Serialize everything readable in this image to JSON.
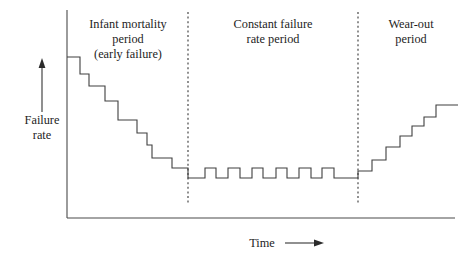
{
  "figure": {
    "background_color": "#ffffff",
    "line_color": "#3f3f3f",
    "text_color": "#1d1d1d"
  },
  "axes": {
    "y_axis_label_line1": "Failure",
    "y_axis_label_line2": "rate",
    "x_axis_label": "Time",
    "y_axis_arrow_direction": "up",
    "x_axis_arrow_direction": "right"
  },
  "regions": [
    {
      "id": "infant-mortality",
      "label_lines": [
        "Infant mortality",
        "period",
        "(early failure)"
      ],
      "label_center_x": 128,
      "label_top_y": 28
    },
    {
      "id": "constant-failure-rate",
      "label_lines": [
        "Constant failure",
        "rate period"
      ],
      "label_center_x": 273,
      "label_top_y": 28
    },
    {
      "id": "wear-out",
      "label_lines": [
        "Wear-out",
        "period"
      ],
      "label_center_x": 411,
      "label_top_y": 28
    }
  ],
  "dividers": [
    {
      "id": "divider-1",
      "x": 188,
      "y_top": 12,
      "y_bottom": 205
    },
    {
      "id": "divider-2",
      "x": 358,
      "y_top": 12,
      "y_bottom": 205
    }
  ],
  "chart_data": {
    "type": "line",
    "xlabel": "Time",
    "ylabel": "Failure rate",
    "grid": false,
    "legend": null,
    "axis_ranges": {
      "x_pixels": [
        67,
        455
      ],
      "y_pixels_top_to_bottom": [
        10,
        218
      ],
      "x_values": [
        0,
        100
      ],
      "y_values": [
        0,
        100
      ]
    },
    "annotations": [
      "Infant mortality period (early failure)",
      "Constant failure rate period",
      "Wear-out period"
    ],
    "phase_boundaries_x": [
      188,
      358
    ],
    "step_points": [
      [
        67,
        57
      ],
      [
        80,
        57
      ],
      [
        80,
        74
      ],
      [
        89,
        74
      ],
      [
        89,
        86
      ],
      [
        105,
        86
      ],
      [
        105,
        101
      ],
      [
        118,
        101
      ],
      [
        118,
        120
      ],
      [
        137,
        120
      ],
      [
        137,
        133
      ],
      [
        147,
        133
      ],
      [
        147,
        145
      ],
      [
        152,
        145
      ],
      [
        152,
        158
      ],
      [
        172,
        158
      ],
      [
        172,
        168
      ],
      [
        188,
        168
      ],
      [
        188,
        178
      ],
      [
        205,
        178
      ],
      [
        205,
        168
      ],
      [
        216,
        168
      ],
      [
        216,
        178
      ],
      [
        228,
        178
      ],
      [
        228,
        168
      ],
      [
        240,
        168
      ],
      [
        240,
        178
      ],
      [
        252,
        178
      ],
      [
        252,
        168
      ],
      [
        263,
        168
      ],
      [
        263,
        178
      ],
      [
        276,
        178
      ],
      [
        276,
        168
      ],
      [
        287,
        168
      ],
      [
        287,
        178
      ],
      [
        299,
        178
      ],
      [
        299,
        168
      ],
      [
        311,
        168
      ],
      [
        311,
        178
      ],
      [
        322,
        178
      ],
      [
        322,
        168
      ],
      [
        334,
        168
      ],
      [
        334,
        178
      ],
      [
        358,
        178
      ],
      [
        358,
        171
      ],
      [
        372,
        171
      ],
      [
        372,
        160
      ],
      [
        386,
        160
      ],
      [
        386,
        147
      ],
      [
        400,
        147
      ],
      [
        400,
        136
      ],
      [
        412,
        136
      ],
      [
        412,
        126
      ],
      [
        424,
        126
      ],
      [
        424,
        117
      ],
      [
        436,
        117
      ],
      [
        436,
        105
      ],
      [
        458,
        105
      ]
    ]
  }
}
